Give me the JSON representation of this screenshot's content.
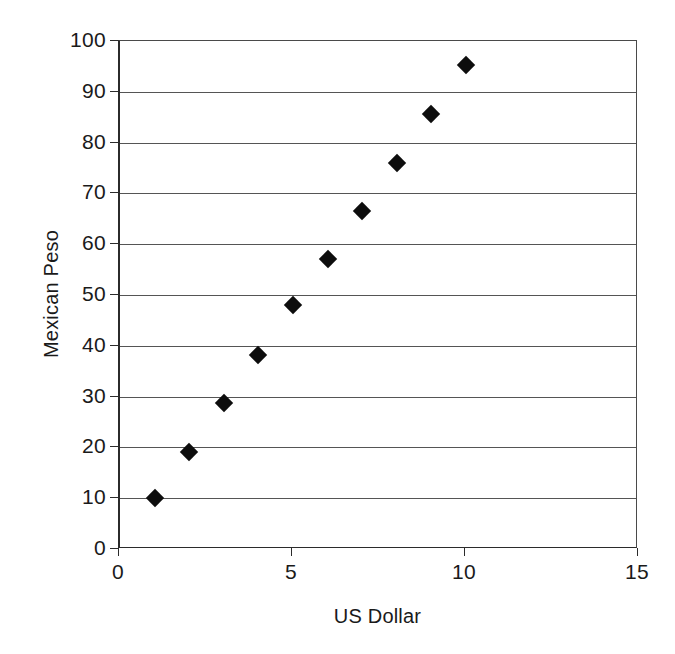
{
  "chart_data": {
    "type": "scatter",
    "title": "",
    "xlabel": "US Dollar",
    "ylabel": "Mexican Peso",
    "xlim": [
      0,
      15
    ],
    "ylim": [
      0,
      100
    ],
    "xticks": [
      "0",
      "5",
      "10",
      "15"
    ],
    "xtick_values": [
      0,
      5,
      10,
      15
    ],
    "yticks": [
      "0",
      "10",
      "20",
      "30",
      "40",
      "50",
      "60",
      "70",
      "80",
      "90",
      "100"
    ],
    "ytick_values": [
      0,
      10,
      20,
      30,
      40,
      50,
      60,
      70,
      80,
      90,
      100
    ],
    "grid": "horizontal",
    "legend": "none",
    "marker": "diamond",
    "marker_color": "#0d0d0d",
    "axis_color": "#2b2b2b",
    "gridline_color": "#555555",
    "background": "#ffffff",
    "series": [
      {
        "name": "US Dollar vs Mexican Peso",
        "x": [
          1,
          2,
          3,
          4,
          5,
          6,
          7,
          8,
          9,
          10
        ],
        "y": [
          10,
          19,
          28.8,
          38.2,
          48,
          57,
          66.5,
          76,
          85.7,
          95.2
        ]
      }
    ]
  }
}
